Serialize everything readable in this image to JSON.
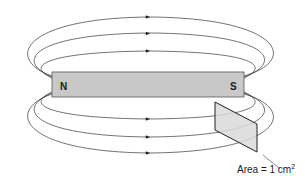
{
  "diagram": {
    "type": "bar magnet magnetic field lines",
    "magnet": {
      "north_label": "N",
      "south_label": "S",
      "fill": "#c8c8c8"
    },
    "field_lines": {
      "above_count": 3,
      "below_count": 3,
      "direction": "left-to-right outside magnet (N to S)",
      "stroke": "#333333"
    },
    "area_plane": {
      "fill": "#d9d9d9",
      "label_prefix": "Area = 1 cm",
      "label_exponent": "2"
    }
  }
}
